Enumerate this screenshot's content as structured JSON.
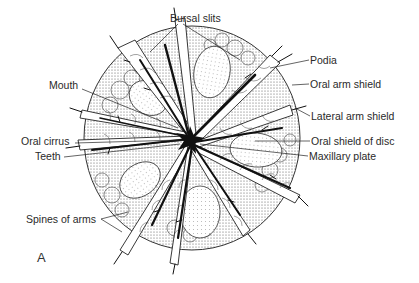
{
  "figure": {
    "panel_letter": "A",
    "labels": {
      "bursal_slits": "Bursal slits",
      "podia": "Podia",
      "mouth": "Mouth",
      "oral_arm_shield": "Oral arm shield",
      "lateral_arm_shield": "Lateral arm shield",
      "oral_cirrus": "Oral cirrus",
      "oral_shield_of_disc": "Oral shield of disc",
      "teeth": "Teeth",
      "maxillary_plate": "Maxillary plate",
      "spines_of_arms": "Spines of arms"
    }
  }
}
